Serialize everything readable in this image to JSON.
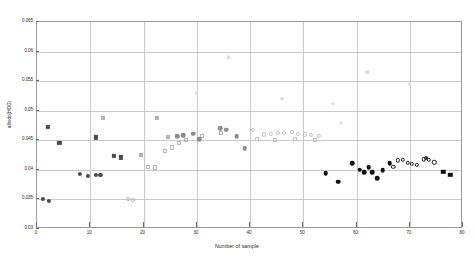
{
  "chart_data": {
    "type": "scatter",
    "title": "",
    "xlabel": "Number of sample",
    "ylabel": "albedo(HOG)",
    "xlim": [
      0,
      80
    ],
    "ylim": [
      0.03,
      0.065
    ],
    "xticks": [
      0,
      10,
      20,
      30,
      40,
      50,
      60,
      70,
      80
    ],
    "xtick_labels": [
      "0",
      "10",
      "20",
      "30",
      "40",
      "50",
      "60",
      "70",
      "80"
    ],
    "yticks": [
      0.03,
      0.035,
      0.04,
      0.045,
      0.05,
      0.055,
      0.06,
      0.065
    ],
    "ytick_labels": [
      "0.03",
      "0.035",
      "0.04",
      "0.045",
      "0.05",
      "0.055",
      "0.06",
      "0.065"
    ],
    "grid": true,
    "legend": "none",
    "series": [
      {
        "name": "dark-squares-left",
        "marker": "square",
        "filled": true,
        "color": "#4a4a4a",
        "size": 4.2,
        "points": [
          {
            "x": 2.0,
            "y": 0.0472
          },
          {
            "x": 4.2,
            "y": 0.0445
          },
          {
            "x": 11.0,
            "y": 0.0455
          },
          {
            "x": 14.4,
            "y": 0.0423
          },
          {
            "x": 15.8,
            "y": 0.0421
          }
        ]
      },
      {
        "name": "dark-circles-left",
        "marker": "circle",
        "filled": true,
        "color": "#4a4a4a",
        "size": 4.2,
        "points": [
          {
            "x": 1.1,
            "y": 0.0351
          },
          {
            "x": 2.2,
            "y": 0.0348
          },
          {
            "x": 8.0,
            "y": 0.0393
          },
          {
            "x": 9.6,
            "y": 0.039
          },
          {
            "x": 11.0,
            "y": 0.0392
          },
          {
            "x": 11.9,
            "y": 0.0392
          }
        ]
      },
      {
        "name": "light-open-circles-low",
        "marker": "circle",
        "filled": false,
        "color": "#b9b9b9",
        "size": 4.0,
        "points": [
          {
            "x": 17.1,
            "y": 0.035
          },
          {
            "x": 18.0,
            "y": 0.0349
          }
        ]
      },
      {
        "name": "light-gray-markers-mid-left",
        "marker": "square",
        "filled": true,
        "color": "#b4b4b4",
        "size": 4.0,
        "points": [
          {
            "x": 12.4,
            "y": 0.0487
          },
          {
            "x": 19.6,
            "y": 0.0425
          },
          {
            "x": 22.6,
            "y": 0.0487
          },
          {
            "x": 24.6,
            "y": 0.0456
          }
        ]
      },
      {
        "name": "open-squares-rising",
        "marker": "square",
        "filled": false,
        "color": "#b0b0b0",
        "size": 4.2,
        "points": [
          {
            "x": 20.9,
            "y": 0.0405
          },
          {
            "x": 22.2,
            "y": 0.0404
          },
          {
            "x": 24.0,
            "y": 0.0432
          },
          {
            "x": 25.4,
            "y": 0.0438
          },
          {
            "x": 26.7,
            "y": 0.0446
          },
          {
            "x": 28.0,
            "y": 0.0451
          },
          {
            "x": 31.0,
            "y": 0.0457
          },
          {
            "x": 34.5,
            "y": 0.0463
          }
        ]
      },
      {
        "name": "mid-gray-filled-circles-arch",
        "marker": "circle",
        "filled": true,
        "color": "#8d8d8d",
        "size": 4.6,
        "points": [
          {
            "x": 26.3,
            "y": 0.0457
          },
          {
            "x": 27.4,
            "y": 0.0459
          },
          {
            "x": 29.3,
            "y": 0.0461
          },
          {
            "x": 30.5,
            "y": 0.0452
          },
          {
            "x": 34.4,
            "y": 0.047
          },
          {
            "x": 35.5,
            "y": 0.0468
          },
          {
            "x": 37.5,
            "y": 0.0457
          },
          {
            "x": 39.0,
            "y": 0.0437
          }
        ]
      },
      {
        "name": "light-open-circles-plateau",
        "marker": "circle",
        "filled": false,
        "color": "#c2c2c2",
        "size": 4.2,
        "points": [
          {
            "x": 40.5,
            "y": 0.0468
          },
          {
            "x": 42.6,
            "y": 0.046
          },
          {
            "x": 43.9,
            "y": 0.0461
          },
          {
            "x": 45.2,
            "y": 0.0462
          },
          {
            "x": 46.4,
            "y": 0.0463
          },
          {
            "x": 47.8,
            "y": 0.0464
          },
          {
            "x": 49.0,
            "y": 0.0461
          },
          {
            "x": 50.3,
            "y": 0.046
          },
          {
            "x": 51.5,
            "y": 0.0459
          },
          {
            "x": 53.0,
            "y": 0.0457
          }
        ]
      },
      {
        "name": "light-open-squares-plateau",
        "marker": "square",
        "filled": false,
        "color": "#c6c6c6",
        "size": 4.0,
        "points": [
          {
            "x": 41.3,
            "y": 0.0452
          },
          {
            "x": 44.6,
            "y": 0.045
          },
          {
            "x": 48.4,
            "y": 0.0452
          },
          {
            "x": 52.2,
            "y": 0.045
          }
        ]
      },
      {
        "name": "faint-scatter-upper",
        "marker": "circle",
        "filled": true,
        "color": "#dcdcdc",
        "size": 3.6,
        "points": [
          {
            "x": 30.0,
            "y": 0.053
          },
          {
            "x": 46.0,
            "y": 0.052
          },
          {
            "x": 55.5,
            "y": 0.0512
          },
          {
            "x": 62.0,
            "y": 0.0565
          },
          {
            "x": 70.0,
            "y": 0.0545
          },
          {
            "x": 36.0,
            "y": 0.059
          },
          {
            "x": 57.0,
            "y": 0.048
          }
        ]
      },
      {
        "name": "black-filled-circles-right",
        "marker": "circle",
        "filled": true,
        "color": "#111111",
        "size": 4.6,
        "points": [
          {
            "x": 54.2,
            "y": 0.0394
          },
          {
            "x": 56.6,
            "y": 0.038
          },
          {
            "x": 59.2,
            "y": 0.0411
          },
          {
            "x": 60.6,
            "y": 0.04
          },
          {
            "x": 61.4,
            "y": 0.0396
          },
          {
            "x": 62.3,
            "y": 0.0404
          },
          {
            "x": 63.0,
            "y": 0.0396
          },
          {
            "x": 63.9,
            "y": 0.0386
          },
          {
            "x": 64.9,
            "y": 0.0399
          },
          {
            "x": 66.2,
            "y": 0.0411
          }
        ]
      },
      {
        "name": "open-circles-right",
        "marker": "circle",
        "filled": false,
        "color": "#1a1a1a",
        "size": 4.4,
        "points": [
          {
            "x": 66.9,
            "y": 0.0405
          },
          {
            "x": 67.8,
            "y": 0.0416
          },
          {
            "x": 68.7,
            "y": 0.0417
          },
          {
            "x": 69.6,
            "y": 0.0412
          },
          {
            "x": 70.4,
            "y": 0.041
          },
          {
            "x": 71.3,
            "y": 0.0409
          },
          {
            "x": 72.6,
            "y": 0.0418
          },
          {
            "x": 73.6,
            "y": 0.0417
          },
          {
            "x": 74.6,
            "y": 0.0413
          }
        ]
      },
      {
        "name": "star-marker-right",
        "marker": "circle",
        "filled": true,
        "color": "#3a3a3a",
        "size": 3.8,
        "points": [
          {
            "x": 73.0,
            "y": 0.042
          }
        ]
      },
      {
        "name": "black-squares-far-right",
        "marker": "square",
        "filled": true,
        "color": "#111111",
        "size": 4.4,
        "points": [
          {
            "x": 76.3,
            "y": 0.0397
          },
          {
            "x": 77.6,
            "y": 0.0392
          }
        ]
      }
    ]
  }
}
